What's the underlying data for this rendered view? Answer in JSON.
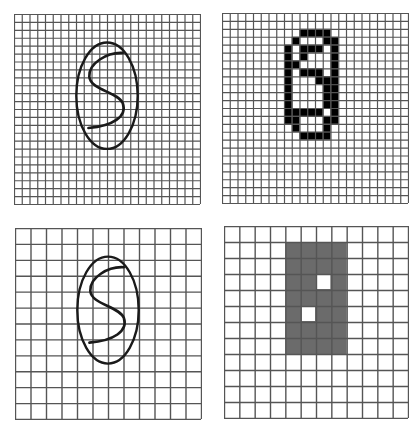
{
  "figure": {
    "colors": {
      "background": "#ffffff",
      "grid_line": "#555555",
      "stroke": "#1a1a1a",
      "filled_pixel": "#000000",
      "gray_pixel": "#6b6b6b"
    },
    "panels": [
      {
        "id": "top-left",
        "label": "fine grid with handwritten stroke",
        "x": 14,
        "y": 14,
        "width": 186,
        "height": 190,
        "cols": 24,
        "rows": 24,
        "content": "stroke"
      },
      {
        "id": "top-right",
        "label": "fine grid binarized pixels",
        "x": 222,
        "y": 13,
        "width": 186,
        "height": 190,
        "cols": 24,
        "rows": 24,
        "content": "bitmap",
        "filled": [
          [
            2,
            10
          ],
          [
            2,
            11
          ],
          [
            2,
            12
          ],
          [
            2,
            13
          ],
          [
            3,
            9
          ],
          [
            3,
            13
          ],
          [
            3,
            14
          ],
          [
            4,
            8
          ],
          [
            4,
            10
          ],
          [
            4,
            11
          ],
          [
            4,
            12
          ],
          [
            4,
            14
          ],
          [
            5,
            8
          ],
          [
            5,
            10
          ],
          [
            5,
            14
          ],
          [
            6,
            8
          ],
          [
            6,
            9
          ],
          [
            6,
            14
          ],
          [
            7,
            8
          ],
          [
            7,
            10
          ],
          [
            7,
            11
          ],
          [
            7,
            12
          ],
          [
            7,
            14
          ],
          [
            8,
            8
          ],
          [
            8,
            12
          ],
          [
            8,
            13
          ],
          [
            8,
            14
          ],
          [
            9,
            8
          ],
          [
            9,
            13
          ],
          [
            9,
            14
          ],
          [
            10,
            8
          ],
          [
            10,
            13
          ],
          [
            10,
            14
          ],
          [
            11,
            8
          ],
          [
            11,
            13
          ],
          [
            11,
            14
          ],
          [
            12,
            8
          ],
          [
            12,
            9
          ],
          [
            12,
            10
          ],
          [
            12,
            11
          ],
          [
            12,
            12
          ],
          [
            12,
            14
          ],
          [
            13,
            8
          ],
          [
            13,
            9
          ],
          [
            13,
            13
          ],
          [
            13,
            14
          ],
          [
            14,
            9
          ],
          [
            14,
            13
          ],
          [
            15,
            10
          ],
          [
            15,
            11
          ],
          [
            15,
            12
          ],
          [
            15,
            13
          ]
        ]
      },
      {
        "id": "bottom-left",
        "label": "coarse grid with handwritten stroke",
        "x": 15,
        "y": 228,
        "width": 186,
        "height": 191,
        "cols": 12,
        "rows": 12,
        "content": "stroke"
      },
      {
        "id": "bottom-right",
        "label": "coarse grid gray pixels",
        "x": 224,
        "y": 226,
        "width": 184,
        "height": 192,
        "cols": 12,
        "rows": 12,
        "content": "bitmap",
        "gray_block": {
          "col_start": 4,
          "col_end": 7,
          "row_start": 1,
          "row_end": 7
        },
        "white_holes": [
          [
            3,
            6
          ],
          [
            5,
            5
          ]
        ]
      }
    ],
    "stroke": {
      "ellipse": {
        "cx": 0.5,
        "cy": 0.43,
        "rx": 0.165,
        "ry": 0.28
      },
      "path": "S-shaped curve"
    }
  }
}
